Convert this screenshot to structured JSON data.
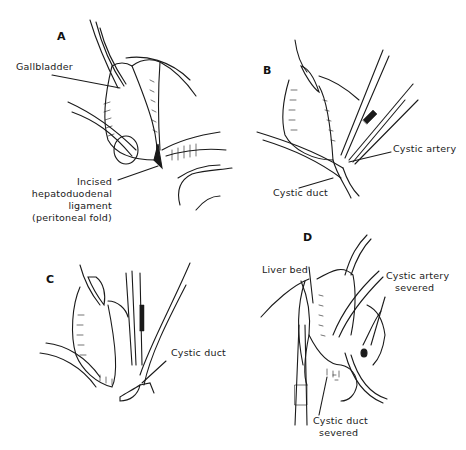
{
  "figure": {
    "panels": [
      {
        "id": "A",
        "letter": "A",
        "labels": {
          "gallbladder": "Gallbladder",
          "incised_line1": "Incised",
          "incised_line2": "hepatoduodenal",
          "incised_line3": "ligament",
          "incised_line4": "(peritoneal fold)"
        }
      },
      {
        "id": "B",
        "letter": "B",
        "labels": {
          "cystic_artery": "Cystic artery",
          "cystic_duct": "Cystic duct"
        }
      },
      {
        "id": "C",
        "letter": "C",
        "labels": {
          "cystic_duct": "Cystic duct"
        }
      },
      {
        "id": "D",
        "letter": "D",
        "labels": {
          "liver_bed": "Liver bed",
          "cystic_artery_line1": "Cystic artery",
          "cystic_artery_line2": "severed",
          "cystic_duct_line1": "Cystic duct",
          "cystic_duct_line2": "severed"
        }
      }
    ]
  }
}
